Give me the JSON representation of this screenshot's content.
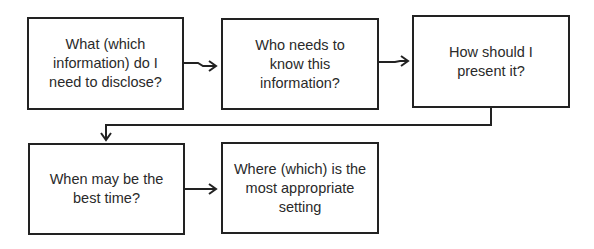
{
  "diagram": {
    "type": "flowchart",
    "nodes": [
      {
        "id": "what",
        "label": "What (which information) do I need to disclose?"
      },
      {
        "id": "who",
        "label": "Who needs to know this information?"
      },
      {
        "id": "how",
        "label": "How should I present it?"
      },
      {
        "id": "when",
        "label": "When may be the best time?"
      },
      {
        "id": "where",
        "label": "Where (which) is the most appropriate setting"
      }
    ],
    "edges": [
      {
        "from": "what",
        "to": "who"
      },
      {
        "from": "who",
        "to": "how"
      },
      {
        "from": "how",
        "to": "when"
      },
      {
        "from": "when",
        "to": "where"
      }
    ],
    "colors": {
      "stroke": "#222222",
      "background": "#ffffff",
      "text": "#2a2a2a"
    }
  }
}
